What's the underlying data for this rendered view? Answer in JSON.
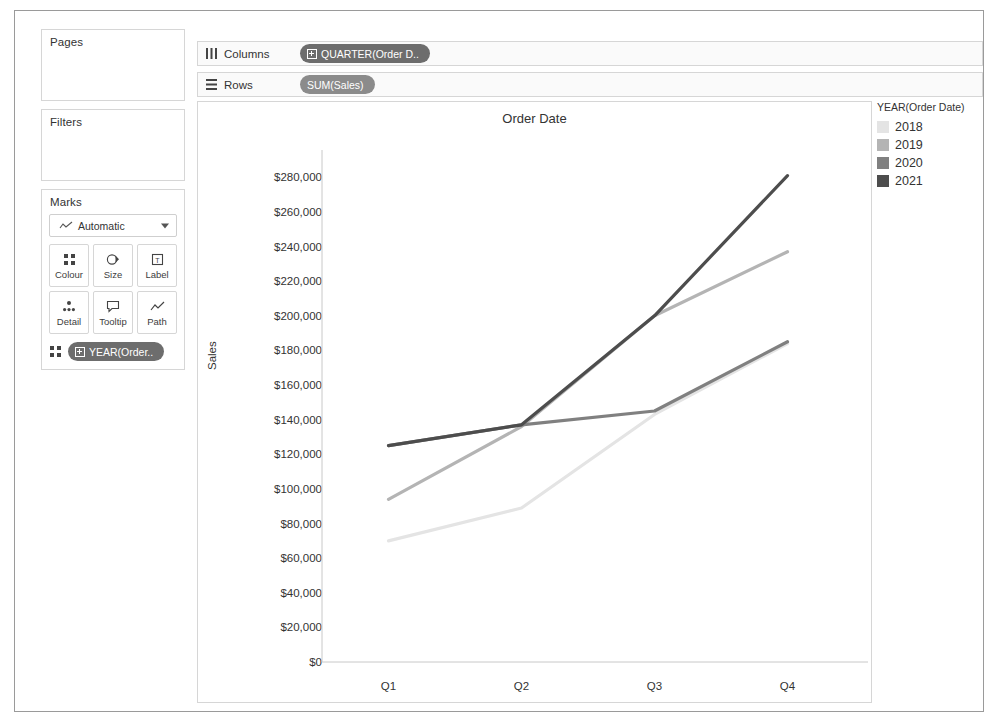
{
  "left_panel": {
    "pages": {
      "title": "Pages"
    },
    "filters": {
      "title": "Filters"
    },
    "marks": {
      "title": "Marks",
      "type_selector": {
        "value": "Automatic",
        "icon": "line-chart-icon",
        "caret": "chevron-down-icon"
      },
      "buttons": [
        {
          "label": "Colour",
          "icon": "colour-icon"
        },
        {
          "label": "Size",
          "icon": "size-icon"
        },
        {
          "label": "Label",
          "icon": "label-icon"
        },
        {
          "label": "Detail",
          "icon": "detail-icon"
        },
        {
          "label": "Tooltip",
          "icon": "tooltip-icon"
        },
        {
          "label": "Path",
          "icon": "path-icon"
        }
      ],
      "encoding_pill": {
        "icon": "colour-icon",
        "label": "YEAR(Order..",
        "field_icon": "dimension-icon"
      }
    }
  },
  "shelves": [
    {
      "name": "columns",
      "label": "Columns",
      "icon": "columns-icon",
      "pill": "QUARTER(Order D..",
      "pill_kind": "blue"
    },
    {
      "name": "rows",
      "label": "Rows",
      "icon": "rows-icon",
      "pill": "SUM(Sales)",
      "pill_kind": "green"
    }
  ],
  "legend": {
    "title": "YEAR(Order Date)",
    "items": [
      {
        "label": "2018",
        "colour": "#e4e4e4"
      },
      {
        "label": "2019",
        "colour": "#b4b4b4"
      },
      {
        "label": "2020",
        "colour": "#808080"
      },
      {
        "label": "2021",
        "colour": "#4d4d4d"
      }
    ]
  },
  "chart_data": {
    "type": "line",
    "title": "Order Date",
    "xlabel": "",
    "ylabel": "Sales",
    "categories": [
      "Q1",
      "Q2",
      "Q3",
      "Q4"
    ],
    "ylim": [
      0,
      290000
    ],
    "yticks": [
      0,
      20000,
      40000,
      60000,
      80000,
      100000,
      120000,
      140000,
      160000,
      180000,
      200000,
      220000,
      240000,
      260000,
      280000
    ],
    "ytick_labels": [
      "$0",
      "$20,000",
      "$40,000",
      "$60,000",
      "$80,000",
      "$100,000",
      "$120,000",
      "$140,000",
      "$160,000",
      "$180,000",
      "$200,000",
      "$220,000",
      "$240,000",
      "$260,000",
      "$280,000"
    ],
    "grid": false,
    "legend_position": "right",
    "series": [
      {
        "name": "2018",
        "colour": "#e4e4e4",
        "values": [
          70000,
          89000,
          143000,
          184000
        ]
      },
      {
        "name": "2019",
        "colour": "#b4b4b4",
        "values": [
          94000,
          136000,
          200000,
          237000
        ]
      },
      {
        "name": "2020",
        "colour": "#808080",
        "values": [
          125000,
          137000,
          145000,
          185000
        ]
      },
      {
        "name": "2021",
        "colour": "#4d4d4d",
        "values": [
          125000,
          137000,
          200000,
          281000
        ]
      }
    ]
  }
}
